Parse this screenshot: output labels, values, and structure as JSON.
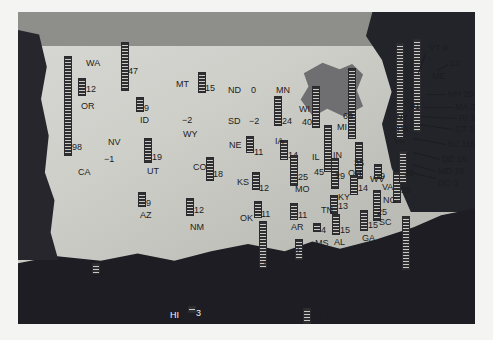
{
  "legend": {
    "unit_label": "= 10",
    "unit_value": 10
  },
  "chart_data": {
    "type": "bar",
    "title": "",
    "xlabel": "",
    "ylabel": "",
    "legend_position": "bottom-center",
    "legend_note": "= 10",
    "unit_per_symbol": 10,
    "grid": false,
    "categories": [
      "WA",
      "OR",
      "CA",
      "NV",
      "ID",
      "MT",
      "WY",
      "UT",
      "AZ",
      "NM",
      "CO",
      "ND",
      "SD",
      "NE",
      "KS",
      "OK",
      "TX",
      "MN",
      "IA",
      "MO",
      "AR",
      "LA",
      "WI",
      "IL",
      "MI",
      "IN",
      "OH",
      "KY",
      "TN",
      "MS",
      "AL",
      "GA",
      "FL",
      "SC",
      "NC",
      "VA",
      "WV",
      "PA",
      "NY",
      "VT",
      "ME",
      "NH",
      "MA",
      "RI",
      "CT",
      "NJ",
      "DE",
      "MD",
      "DC",
      "AK",
      "HI"
    ],
    "values": [
      47,
      12,
      98,
      -1,
      9,
      15,
      -2,
      19,
      9,
      12,
      18,
      0,
      -2,
      11,
      12,
      11,
      45,
      24,
      14,
      25,
      11,
      15,
      40,
      45,
      69,
      29,
      35,
      14,
      13,
      4,
      15,
      15,
      52,
      25,
      29,
      30,
      9,
      95,
      91,
      9,
      12,
      20,
      32,
      12,
      16,
      116,
      15,
      19,
      1,
      6,
      3
    ],
    "ylim": [
      -2,
      116
    ]
  },
  "map": {
    "states": [
      {
        "abbr": "WA",
        "value": "47",
        "ax": 68,
        "ay": 47,
        "bx": 103,
        "by": 30,
        "bh": 47,
        "lx": 110,
        "ly": 55
      },
      {
        "abbr": "OR",
        "value": "12",
        "ax": 63,
        "ay": 90,
        "bx": 60,
        "by": 66,
        "bh": 16,
        "lx": 68,
        "ly": 73
      },
      {
        "abbr": "CA",
        "value": "98",
        "ax": 60,
        "ay": 156,
        "bx": 46,
        "by": 44,
        "bh": 98,
        "lx": 54,
        "ly": 131
      },
      {
        "abbr": "NV",
        "value": "-1",
        "ax": 90,
        "ay": 126,
        "bx": 0,
        "by": 0,
        "bh": 0,
        "lx": 86,
        "ly": 143,
        "negative": true
      },
      {
        "abbr": "ID",
        "value": "9",
        "ax": 122,
        "ay": 104,
        "bx": 118,
        "by": 85,
        "bh": 13,
        "lx": 126,
        "ly": 92
      },
      {
        "abbr": "MT",
        "value": "15",
        "ax": 158,
        "ay": 68,
        "bx": 180,
        "by": 60,
        "bh": 19,
        "lx": 187,
        "ly": 72
      },
      {
        "abbr": "WY",
        "value": "-2",
        "ax": 165,
        "ay": 118,
        "bx": 0,
        "by": 0,
        "bh": 0,
        "lx": 164,
        "ly": 104,
        "negative": true
      },
      {
        "abbr": "UT",
        "value": "19",
        "ax": 129,
        "ay": 155,
        "bx": 126,
        "by": 126,
        "bh": 23,
        "lx": 134,
        "ly": 141
      },
      {
        "abbr": "AZ",
        "value": "9",
        "ax": 122,
        "ay": 199,
        "bx": 120,
        "by": 180,
        "bh": 13,
        "lx": 128,
        "ly": 187
      },
      {
        "abbr": "NM",
        "value": "12",
        "ax": 172,
        "ay": 211,
        "bx": 168,
        "by": 186,
        "bh": 16,
        "lx": 176,
        "ly": 194
      },
      {
        "abbr": "CO",
        "value": "18",
        "ax": 175,
        "ay": 151,
        "bx": 188,
        "by": 145,
        "bh": 22,
        "lx": 195,
        "ly": 158
      },
      {
        "abbr": "ND",
        "value": "0",
        "ax": 210,
        "ay": 74,
        "bx": 0,
        "by": 0,
        "bh": 0,
        "lx": 233,
        "ly": 74
      },
      {
        "abbr": "SD",
        "value": "-2",
        "ax": 210,
        "ay": 105,
        "bx": 0,
        "by": 0,
        "bh": 0,
        "lx": 231,
        "ly": 105,
        "negative": true
      },
      {
        "abbr": "NE",
        "value": "11",
        "ax": 211,
        "ay": 129,
        "bx": 228,
        "by": 124,
        "bh": 15,
        "lx": 236,
        "ly": 136
      },
      {
        "abbr": "KS",
        "value": "12",
        "ax": 219,
        "ay": 166,
        "bx": 234,
        "by": 160,
        "bh": 16,
        "lx": 241,
        "ly": 172
      },
      {
        "abbr": "OK",
        "value": "11",
        "ax": 222,
        "ay": 202,
        "bx": 236,
        "by": 189,
        "bh": 15,
        "lx": 243,
        "ly": 198
      },
      {
        "abbr": "TX",
        "value": "45",
        "ax": 215,
        "ay": 236,
        "bx": 241,
        "by": 209,
        "bh": 45,
        "lx": 246,
        "ly": 246
      },
      {
        "abbr": "MN",
        "value": "24",
        "ax": 258,
        "ay": 74,
        "bx": 256,
        "by": 84,
        "bh": 28,
        "lx": 264,
        "ly": 105
      },
      {
        "abbr": "IA",
        "value": "14",
        "ax": 257,
        "ay": 125,
        "bx": 262,
        "by": 128,
        "bh": 18,
        "lx": 270,
        "ly": 139
      },
      {
        "abbr": "MO",
        "value": "25",
        "ax": 277,
        "ay": 173,
        "bx": 272,
        "by": 143,
        "bh": 29,
        "lx": 280,
        "ly": 161
      },
      {
        "abbr": "AR",
        "value": "11",
        "ax": 273,
        "ay": 211,
        "bx": 272,
        "by": 191,
        "bh": 15,
        "lx": 280,
        "ly": 199
      },
      {
        "abbr": "LA",
        "value": "15",
        "ax": 279,
        "ay": 234,
        "bx": 277,
        "by": 227,
        "bh": 19,
        "lx": 285,
        "ly": 241
      },
      {
        "abbr": "WI",
        "value": "40",
        "ax": 281,
        "ay": 93,
        "bx": 294,
        "by": 74,
        "bh": 40,
        "lx": 284,
        "ly": 106
      },
      {
        "abbr": "IL",
        "value": "45",
        "ax": 294,
        "ay": 141,
        "bx": 306,
        "by": 113,
        "bh": 45,
        "lx": 296,
        "ly": 156
      },
      {
        "abbr": "MI",
        "value": "69",
        "ax": 319,
        "ay": 111,
        "bx": 330,
        "by": 56,
        "bh": 69,
        "lx": 325,
        "ly": 100
      },
      {
        "abbr": "IN",
        "value": "29",
        "ax": 315,
        "ay": 139,
        "bx": 313,
        "by": 146,
        "bh": 29,
        "lx": 317,
        "ly": 160
      },
      {
        "abbr": "OH",
        "value": "35",
        "ax": 330,
        "ay": 157,
        "bx": 337,
        "by": 130,
        "bh": 35,
        "lx": 336,
        "ly": 147
      },
      {
        "abbr": "KY",
        "value": "14",
        "ax": 320,
        "ay": 181,
        "bx": 332,
        "by": 163,
        "bh": 18,
        "lx": 340,
        "ly": 172
      },
      {
        "abbr": "TN",
        "value": "13",
        "ax": 303,
        "ay": 194,
        "bx": 312,
        "by": 183,
        "bh": 17,
        "lx": 320,
        "ly": 190
      },
      {
        "abbr": "MS",
        "value": "4",
        "ax": 297,
        "ay": 227,
        "bx": 295,
        "by": 211,
        "bh": 7,
        "lx": 303,
        "ly": 214
      },
      {
        "abbr": "AL",
        "value": "15",
        "ax": 316,
        "ay": 226,
        "bx": 314,
        "by": 202,
        "bh": 19,
        "lx": 322,
        "ly": 214
      },
      {
        "abbr": "GA",
        "value": "15",
        "ax": 344,
        "ay": 222,
        "bx": 342,
        "by": 198,
        "bh": 19,
        "lx": 350,
        "ly": 209
      },
      {
        "abbr": "FL",
        "value": "52",
        "ax": 376,
        "ay": 266,
        "bx": 384,
        "by": 204,
        "bh": 52,
        "lx": 372,
        "ly": 250
      },
      {
        "abbr": "SC",
        "value": "25",
        "ax": 361,
        "ay": 206,
        "bx": 355,
        "by": 178,
        "bh": 29,
        "lx": 359,
        "ly": 196
      },
      {
        "abbr": "NC",
        "value": "29",
        "ax": 365,
        "ay": 184,
        "bx": 375,
        "by": 160,
        "bh": 29,
        "lx": 383,
        "ly": 174
      },
      {
        "abbr": "VA",
        "value": "30",
        "ax": 364,
        "ay": 171,
        "bx": 381,
        "by": 139,
        "bh": 30,
        "lx": 386,
        "ly": 157
      },
      {
        "abbr": "WV",
        "value": "9",
        "ax": 352,
        "ay": 163,
        "bx": 356,
        "by": 152,
        "bh": 13,
        "lx": 362,
        "ly": 160
      },
      {
        "abbr": "PA",
        "value": "95",
        "ax": 379,
        "ay": 113,
        "bx": 378,
        "by": 31,
        "bh": 95,
        "lx": 376,
        "ly": 124
      },
      {
        "abbr": "NY",
        "value": "91",
        "ax": 378,
        "ay": 101,
        "bx": 395,
        "by": 27,
        "bh": 91,
        "lx": 392,
        "ly": 90
      }
    ],
    "callouts": [
      {
        "label": "VT 9",
        "lx": 411,
        "ly": 32,
        "x1": 408,
        "y1": 40,
        "x2": 400,
        "y2": 62
      },
      {
        "label": "12",
        "lx": 432,
        "ly": 47,
        "x1": 430,
        "y1": 52,
        "x2": 420,
        "y2": 58
      },
      {
        "label": "NH 20",
        "lx": 430,
        "ly": 78,
        "x1": 428,
        "y1": 82,
        "x2": 408,
        "y2": 82
      },
      {
        "label": "MA 32",
        "lx": 437,
        "ly": 91,
        "x1": 435,
        "y1": 95,
        "x2": 405,
        "y2": 95
      },
      {
        "label": "RI 12",
        "lx": 441,
        "ly": 102,
        "x1": 439,
        "y1": 106,
        "x2": 403,
        "y2": 104
      },
      {
        "label": "CT 16",
        "lx": 437,
        "ly": 113,
        "x1": 435,
        "y1": 117,
        "x2": 400,
        "y2": 112
      },
      {
        "label": "NJ 116",
        "lx": 430,
        "ly": 128,
        "x1": 428,
        "y1": 132,
        "x2": 396,
        "y2": 126
      },
      {
        "label": "DE 15",
        "lx": 424,
        "ly": 143,
        "x1": 422,
        "y1": 147,
        "x2": 396,
        "y2": 140
      },
      {
        "label": "MD 19",
        "lx": 420,
        "ly": 155,
        "x1": 418,
        "y1": 159,
        "x2": 394,
        "y2": 152
      },
      {
        "label": "DC 1",
        "lx": 420,
        "ly": 167,
        "x1": 418,
        "y1": 166,
        "x2": 392,
        "y2": 160
      }
    ],
    "me_label": {
      "abbr": "ME",
      "lx": 414,
      "ly": 60
    },
    "insets": [
      {
        "abbr": "AK",
        "value": "6",
        "ax": 82,
        "ay": 267,
        "bx": 74,
        "by": 251,
        "bh": 9,
        "lx": 82,
        "ly": 255,
        "white": false
      },
      {
        "abbr": "HI",
        "value": "3",
        "ax": 152,
        "ay": 299,
        "bx": 170,
        "by": 294,
        "bh": 5,
        "lx": 178,
        "ly": 297,
        "white": true
      }
    ]
  }
}
